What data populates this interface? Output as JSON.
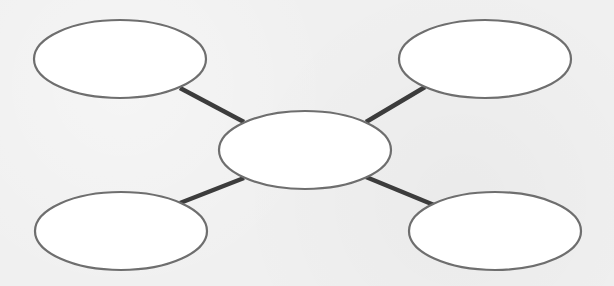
{
  "diagram": {
    "type": "spider-map",
    "colors": {
      "background": "#f0f0f0",
      "node_fill": "#ffffff",
      "node_stroke": "#6e6e6e",
      "connector": "#3c3c3c"
    },
    "center_node": {
      "id": "center",
      "cx": 305,
      "cy": 150,
      "rx": 86,
      "ry": 39,
      "label": ""
    },
    "nodes": [
      {
        "id": "top-left",
        "cx": 120,
        "cy": 59,
        "rx": 86,
        "ry": 39,
        "label": ""
      },
      {
        "id": "top-right",
        "cx": 485,
        "cy": 59,
        "rx": 86,
        "ry": 39,
        "label": ""
      },
      {
        "id": "bottom-left",
        "cx": 121,
        "cy": 231,
        "rx": 86,
        "ry": 39,
        "label": ""
      },
      {
        "id": "bottom-right",
        "cx": 495,
        "cy": 231,
        "rx": 86,
        "ry": 39,
        "label": ""
      }
    ],
    "connectors": [
      {
        "from": "center",
        "to": "top-left",
        "x1": 244,
        "y1": 122,
        "x2": 180,
        "y2": 88
      },
      {
        "from": "center",
        "to": "top-right",
        "x1": 366,
        "y1": 122,
        "x2": 425,
        "y2": 87
      },
      {
        "from": "center",
        "to": "bottom-left",
        "x1": 244,
        "y1": 178,
        "x2": 180,
        "y2": 203
      },
      {
        "from": "center",
        "to": "bottom-right",
        "x1": 366,
        "y1": 177,
        "x2": 434,
        "y2": 205
      }
    ]
  }
}
